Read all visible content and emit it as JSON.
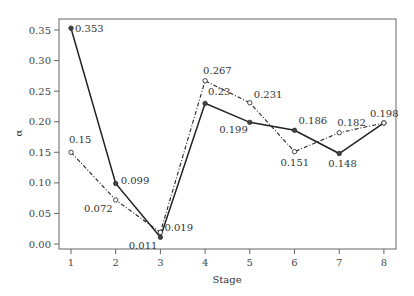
{
  "chart_data": {
    "type": "line",
    "title": "",
    "xlabel": "Stage",
    "ylabel": "α",
    "x": [
      1,
      2,
      3,
      4,
      5,
      6,
      7,
      8
    ],
    "xticks": [
      "1",
      "2",
      "3",
      "4",
      "5",
      "6",
      "7",
      "8"
    ],
    "yticks": [
      "0.00",
      "0.05",
      "0.10",
      "0.15",
      "0.20",
      "0.25",
      "0.30",
      "0.35"
    ],
    "ylim": [
      0.0,
      0.36
    ],
    "xlim": [
      0.7,
      8.25
    ],
    "grid": false,
    "legend": null,
    "series": [
      {
        "name": "series-solid",
        "style": "solid",
        "marker": "filled-circle",
        "values": [
          0.353,
          0.099,
          0.011,
          0.23,
          0.199,
          0.186,
          0.148,
          0.198
        ],
        "labels": [
          "0.353",
          "0.099",
          "0.011",
          "0.23",
          "0.199",
          "0.186",
          "0.148",
          "0.198"
        ]
      },
      {
        "name": "series-dashdot",
        "style": "dash-dot",
        "marker": "open-circle",
        "values": [
          0.15,
          0.072,
          0.019,
          0.267,
          0.231,
          0.151,
          0.182,
          0.198
        ],
        "labels": [
          "0.15",
          "0.072",
          "0.019",
          "0.267",
          "0.231",
          "0.151",
          "0.182",
          ""
        ]
      }
    ]
  },
  "colors": {
    "line": "#222222",
    "axis": "#555555",
    "text": "#333333"
  }
}
